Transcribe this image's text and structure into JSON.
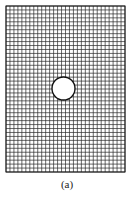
{
  "figure": {
    "type": "mesh-grid-with-hole",
    "grid": {
      "x": 6,
      "y": 6,
      "width": 119,
      "height": 166,
      "columns": 30,
      "rows": 42,
      "line_color": "#2a2a2a",
      "border_color": "#1a1a1a"
    },
    "hole": {
      "cx": 63.5,
      "cy": 88.5,
      "r": 11.5,
      "fill": "#ffffff",
      "stroke": "#111111"
    },
    "caption": "(a)"
  }
}
